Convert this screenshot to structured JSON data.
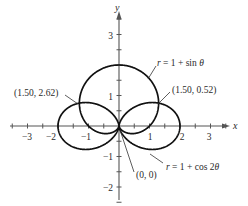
{
  "chart_data": {
    "type": "line",
    "subtype": "polar-curves",
    "title": "",
    "xlabel": "x",
    "ylabel": "y",
    "xlim": [
      -3.5,
      3.6
    ],
    "ylim": [
      -2.5,
      3.7
    ],
    "grid": false,
    "x_ticks": [
      -3,
      -2,
      -1,
      1,
      2,
      3
    ],
    "x_tick_labels": [
      "−3",
      "−2",
      "−1",
      "1",
      "2",
      "3"
    ],
    "y_ticks": [
      -2,
      -1,
      1,
      3
    ],
    "y_tick_labels": [
      "−2",
      "−1",
      "1",
      "3"
    ],
    "minor_tick_step": 0.5,
    "series": [
      {
        "name": "r = 1 + sin θ",
        "equation": "r = 1 + sin(theta)",
        "kind": "cardioid",
        "theta_range": [
          0,
          6.2832
        ]
      },
      {
        "name": "r = 1 + cos 2θ",
        "equation": "r = 1 + cos(2*theta)",
        "kind": "two-petal rose",
        "theta_range": [
          0,
          6.2832
        ]
      }
    ],
    "annotations": [
      {
        "text": "(1.50, 2.62)",
        "point": [
          1.5,
          2.62
        ],
        "note": "polar point (r, θ) — intersection"
      },
      {
        "text": "(1.50, 0.52)",
        "point": [
          1.5,
          0.52
        ],
        "note": "polar point (r, θ) — intersection"
      },
      {
        "text": "(0, 0)",
        "point": [
          0,
          0
        ],
        "note": "pole intersection"
      },
      {
        "text": "r = 1 + sin θ",
        "target": "cardioid"
      },
      {
        "text": "r = 1 + cos 2θ",
        "target": "rose"
      }
    ]
  },
  "labels": {
    "x_axis": "x",
    "y_axis": "y",
    "curve1": {
      "r": "r",
      "rest": " = 1 + sin ",
      "theta": "θ"
    },
    "curve2": {
      "r": "r",
      "rest": " = 1 + cos 2",
      "theta": "θ"
    },
    "point_a": "(1.50, 2.62)",
    "point_b": "(1.50, 0.52)",
    "origin": "(0, 0)",
    "ticks": {
      "xm3": "−3",
      "xm2": "−2",
      "xm1": "−1",
      "x1": "1",
      "x2": "2",
      "x3": "3",
      "y3": "3",
      "y1": "1",
      "ym1": "−1",
      "ym2": "−2"
    }
  },
  "colors": {
    "curve": "#111111",
    "axis": "#555555",
    "text": "#2a2a2a"
  }
}
